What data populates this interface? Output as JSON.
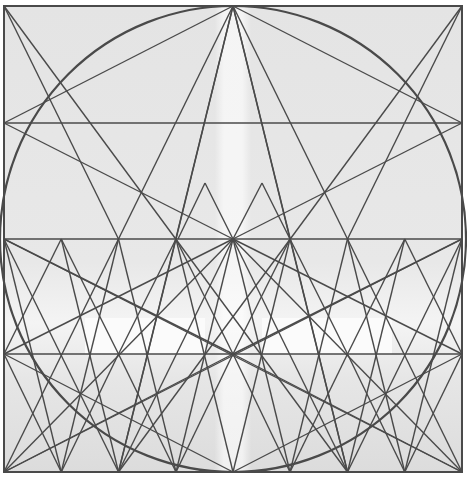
{
  "diagram": {
    "background_photo": "faded cathedral facade with central spire",
    "stroke_color": "#4a4a4a",
    "bg_color": "#e6e6e6",
    "frame": {
      "x1": 4,
      "y1": 6,
      "x2": 462,
      "y2": 472
    },
    "horizontals": [
      123,
      239,
      354
    ],
    "circle": {
      "cx": 233,
      "cy": 239,
      "r": 233
    },
    "bright_bands": [
      {
        "x": 85,
        "y": 318,
        "w": 120,
        "h": 36
      },
      {
        "x": 262,
        "y": 318,
        "w": 130,
        "h": 36
      }
    ],
    "lines": [
      [
        233,
        6,
        4,
        123
      ],
      [
        233,
        6,
        4,
        472
      ],
      [
        233,
        6,
        118.5,
        472
      ],
      [
        233,
        6,
        347.5,
        472
      ],
      [
        233,
        6,
        462,
        472
      ],
      [
        233,
        6,
        462,
        123
      ],
      [
        233,
        6,
        176,
        239
      ],
      [
        233,
        6,
        290,
        239
      ],
      [
        4,
        6,
        347.5,
        472
      ],
      [
        4,
        6,
        118.5,
        239
      ],
      [
        462,
        6,
        118.5,
        472
      ],
      [
        462,
        6,
        347.5,
        239
      ],
      [
        4,
        123,
        462,
        123
      ],
      [
        4,
        239,
        462,
        239
      ],
      [
        4,
        354,
        462,
        354
      ],
      [
        4,
        123,
        233,
        239
      ],
      [
        462,
        123,
        233,
        239
      ],
      [
        4,
        239,
        118.5,
        472
      ],
      [
        462,
        239,
        347.5,
        472
      ],
      [
        4,
        239,
        233,
        354
      ],
      [
        462,
        239,
        233,
        354
      ],
      [
        4,
        354,
        233,
        472
      ],
      [
        462,
        354,
        233,
        472
      ],
      [
        233,
        239,
        4,
        354
      ],
      [
        233,
        239,
        462,
        354
      ],
      [
        233,
        239,
        4,
        472
      ],
      [
        233,
        239,
        462,
        472
      ],
      [
        233,
        239,
        118.5,
        472
      ],
      [
        233,
        239,
        347.5,
        472
      ],
      [
        233,
        239,
        176,
        472
      ],
      [
        233,
        239,
        290,
        472
      ],
      [
        4,
        472,
        233,
        354
      ],
      [
        462,
        472,
        233,
        354
      ],
      [
        4,
        472,
        462,
        239
      ],
      [
        462,
        472,
        4,
        239
      ],
      [
        205,
        183,
        178,
        239
      ],
      [
        205,
        183,
        233,
        239
      ],
      [
        262,
        183,
        233,
        239
      ],
      [
        262,
        183,
        290,
        239
      ],
      [
        61.25,
        239,
        4,
        354
      ],
      [
        61.25,
        239,
        118.5,
        354
      ],
      [
        176,
        239,
        118.5,
        354
      ],
      [
        176,
        239,
        233,
        354
      ],
      [
        290,
        239,
        233,
        354
      ],
      [
        290,
        239,
        347.5,
        354
      ],
      [
        404.75,
        239,
        347.5,
        354
      ],
      [
        404.75,
        239,
        462,
        354
      ],
      [
        4,
        354,
        61.25,
        472
      ],
      [
        118.5,
        354,
        61.25,
        472
      ],
      [
        118.5,
        354,
        176,
        472
      ],
      [
        233,
        354,
        176,
        472
      ],
      [
        233,
        354,
        290,
        472
      ],
      [
        347.5,
        354,
        290,
        472
      ],
      [
        347.5,
        354,
        404.75,
        472
      ],
      [
        462,
        354,
        404.75,
        472
      ],
      [
        61.25,
        239,
        118.5,
        472
      ],
      [
        118.5,
        239,
        61.25,
        472
      ],
      [
        176,
        239,
        233,
        472
      ],
      [
        290,
        239,
        233,
        472
      ],
      [
        347.5,
        239,
        404.75,
        472
      ],
      [
        404.75,
        239,
        347.5,
        472
      ],
      [
        4,
        239,
        61.25,
        472
      ],
      [
        462,
        239,
        404.75,
        472
      ],
      [
        118.5,
        239,
        176,
        472
      ],
      [
        347.5,
        239,
        290,
        472
      ],
      [
        176,
        239,
        118.5,
        472
      ],
      [
        290,
        239,
        347.5,
        472
      ]
    ]
  }
}
